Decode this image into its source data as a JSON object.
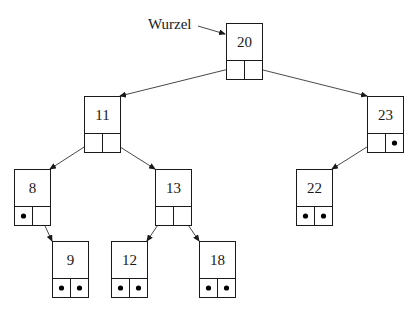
{
  "diagram": {
    "type": "binary-search-tree",
    "root_label": "Wurzel",
    "root_key": "20",
    "node_size": {
      "width": 36,
      "height": 56,
      "key_height": 37
    },
    "colors": {
      "stroke": "#1a1a1a",
      "background": "#ffffff",
      "null_pointer": "#000000"
    },
    "nodes": [
      {
        "id": "n20",
        "key": "20",
        "x": 226,
        "y": 23,
        "left": "n11",
        "right": "n23"
      },
      {
        "id": "n11",
        "key": "11",
        "x": 84,
        "y": 96,
        "left": "n8",
        "right": "n13"
      },
      {
        "id": "n23",
        "key": "23",
        "x": 367,
        "y": 96,
        "left": "n22",
        "right": null
      },
      {
        "id": "n8",
        "key": "8",
        "x": 14,
        "y": 169,
        "left": null,
        "right": "n9"
      },
      {
        "id": "n13",
        "key": "13",
        "x": 155,
        "y": 169,
        "left": "n12",
        "right": "n18"
      },
      {
        "id": "n22",
        "key": "22",
        "x": 296,
        "y": 169,
        "left": null,
        "right": null
      },
      {
        "id": "n9",
        "key": "9",
        "x": 52,
        "y": 241,
        "left": null,
        "right": null
      },
      {
        "id": "n12",
        "key": "12",
        "x": 111,
        "y": 241,
        "left": null,
        "right": null
      },
      {
        "id": "n18",
        "key": "18",
        "x": 199,
        "y": 241,
        "left": null,
        "right": null
      }
    ],
    "edges": [
      {
        "from": "n20",
        "side": "left",
        "to": "n11"
      },
      {
        "from": "n20",
        "side": "right",
        "to": "n23"
      },
      {
        "from": "n11",
        "side": "left",
        "to": "n8"
      },
      {
        "from": "n11",
        "side": "right",
        "to": "n13"
      },
      {
        "from": "n23",
        "side": "left",
        "to": "n22"
      },
      {
        "from": "n8",
        "side": "right",
        "to": "n9"
      },
      {
        "from": "n13",
        "side": "left",
        "to": "n12"
      },
      {
        "from": "n13",
        "side": "right",
        "to": "n18"
      }
    ],
    "null_pointer_symbol": "•"
  }
}
